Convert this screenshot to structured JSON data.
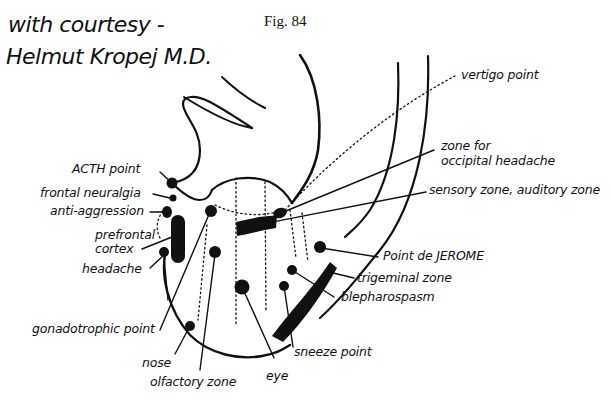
{
  "header": {
    "credit_line1": "with courtesy -",
    "credit_line2": "Helmut Kropej M.D.",
    "figure_number": "Fig. 84"
  },
  "labels": {
    "vertigo_point": "vertigo point",
    "occipital_headache_line1": "zone for",
    "occipital_headache_line2": "occipital headache",
    "sensory_auditory_zone": "sensory zone, auditory zone",
    "point_de_jerome": "Point de JEROME",
    "trigeminal_zone": "trigeminal zone",
    "blepharospasm": "blepharospasm",
    "sneeze_point": "sneeze point",
    "eye": "eye",
    "olfactory_zone": "olfactory zone",
    "nose": "nose",
    "gonadotrophic_point": "gonadotrophic point",
    "headache": "headache",
    "prefrontal_cortex_line1": "prefrontal",
    "prefrontal_cortex_line2": "cortex",
    "anti_aggression": "anti-aggression",
    "frontal_neuralgia": "frontal neuralgia",
    "acth_point": "ACTH point"
  },
  "colors": {
    "ink": "#111111",
    "background": "#ffffff"
  }
}
